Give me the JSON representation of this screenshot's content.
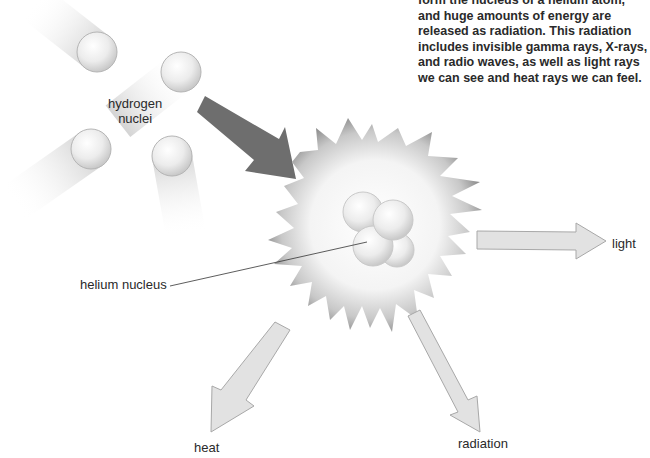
{
  "caption": {
    "text": "form the nucleus of a helium atom, and huge amounts of energy are released as radiation. This radiation includes invisible gamma rays, X-rays, and radio waves, as well as light rays we can see and heat rays we can feel."
  },
  "labels": {
    "hydrogen_line1": "hydrogen",
    "hydrogen_line2": "nuclei",
    "helium": "helium nucleus",
    "light": "light",
    "heat": "heat",
    "radiation": "radiation"
  },
  "colors": {
    "background": "#ffffff",
    "text": "#2a2a2a",
    "dark_arrow": "#6e6e6e",
    "light_arrow_fill": "#e2e2e2",
    "light_arrow_stroke": "#a8a8a8",
    "spike": "#8a8a8a",
    "glow": "#f6f6f6",
    "sphere": "#eeeeee"
  }
}
